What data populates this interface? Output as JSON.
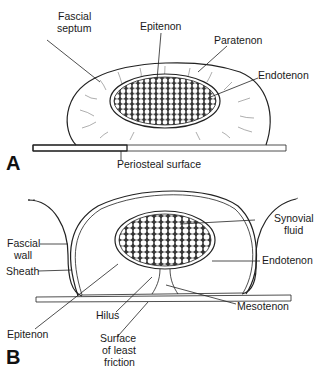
{
  "panel_a": {
    "letter": "A",
    "labels": {
      "fascial_septum_1": "Fascial",
      "fascial_septum_2": "septum",
      "epitenon": "Epitenon",
      "paratenon": "Paratenon",
      "endotenon": "Endotenon",
      "periosteal_surface": "Periosteal surface"
    }
  },
  "panel_b": {
    "letter": "B",
    "labels": {
      "fascial_wall_1": "Fascial",
      "fascial_wall_2": "wall",
      "sheath": "Sheath",
      "synovial_fluid_1": "Synovial",
      "synovial_fluid_2": "fluid",
      "endotenon": "Endotenon",
      "mesotenon": "Mesotenon",
      "hilus": "Hilus",
      "epitenon": "Epitenon",
      "surface_1": "Surface",
      "surface_2": "of least",
      "surface_3": "friction"
    }
  },
  "colors": {
    "ink": "#222222",
    "background": "#ffffff"
  }
}
